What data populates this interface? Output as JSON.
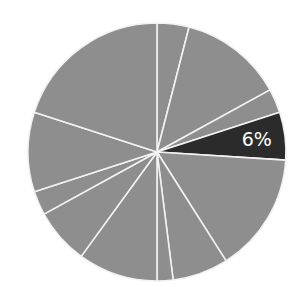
{
  "chart_data": {
    "type": "pie",
    "title": "",
    "start_angle_deg": 0,
    "direction": "clockwise",
    "highlight_index": 3,
    "colors": {
      "default": "#8e8e8e",
      "highlight": "#2b2b2b",
      "separator": "#f2f2f2",
      "label": "#ffffff"
    },
    "slices": [
      {
        "value": 4,
        "label": ""
      },
      {
        "value": 13,
        "label": ""
      },
      {
        "value": 3,
        "label": ""
      },
      {
        "value": 6,
        "label": "6%"
      },
      {
        "value": 15,
        "label": ""
      },
      {
        "value": 7,
        "label": ""
      },
      {
        "value": 2,
        "label": ""
      },
      {
        "value": 10,
        "label": ""
      },
      {
        "value": 7,
        "label": ""
      },
      {
        "value": 3,
        "label": ""
      },
      {
        "value": 10,
        "label": ""
      },
      {
        "value": 20,
        "label": ""
      }
    ],
    "values": [
      4,
      13,
      3,
      6,
      15,
      7,
      2,
      10,
      7,
      3,
      10,
      20
    ],
    "annotations": [
      "6%"
    ]
  }
}
